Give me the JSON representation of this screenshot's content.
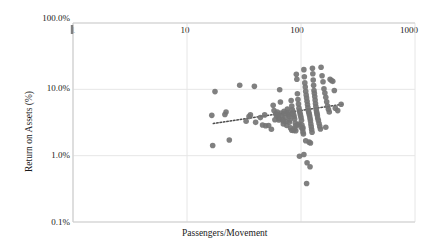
{
  "chart_data": {
    "type": "scatter",
    "title": "",
    "subtitle": "",
    "xlabel": "Passengers/Movement",
    "ylabel": "Return on Assets (%)",
    "x_scale": "log",
    "y_scale": "log",
    "xlim": [
      1,
      1000
    ],
    "ylim": [
      0.001,
      1.0
    ],
    "x_tick_labels": [
      "1",
      "10",
      "100",
      "1000"
    ],
    "x_tick_values": [
      1,
      10,
      100,
      1000
    ],
    "x_axis_position": "top",
    "y_tick_labels": [
      "100.0%",
      "10.0%",
      "1.0%",
      "0.1%"
    ],
    "y_tick_values": [
      1.0,
      0.1,
      0.01,
      0.001
    ],
    "grid": true,
    "grid_axis": "both",
    "legend": "none",
    "marker_color": "#757575",
    "marker_size": 5,
    "trendline": {
      "type": "linear-on-log",
      "style": "dotted",
      "color": "#4d4d4d",
      "x_start": 17,
      "y_start": 0.0305,
      "x_end": 230,
      "y_end": 0.0595
    },
    "series": [
      {
        "name": "Airports",
        "points": [
          [
            17.6,
            0.0925
          ],
          [
            16.5,
            0.0405
          ],
          [
            16.8,
            0.0142
          ],
          [
            22.0,
            0.0455
          ],
          [
            21.5,
            0.0418
          ],
          [
            23.5,
            0.0172
          ],
          [
            29.0,
            0.1155
          ],
          [
            33.0,
            0.033
          ],
          [
            39.0,
            0.111
          ],
          [
            40.0,
            0.0318
          ],
          [
            44.0,
            0.0375
          ],
          [
            46.0,
            0.029
          ],
          [
            49.0,
            0.0282
          ],
          [
            52.0,
            0.0285
          ],
          [
            55.0,
            0.025
          ],
          [
            57.0,
            0.0575
          ],
          [
            58.0,
            0.0478
          ],
          [
            60.0,
            0.043
          ],
          [
            61.0,
            0.0395
          ],
          [
            62.0,
            0.0455
          ],
          [
            63.0,
            0.0412
          ],
          [
            64.0,
            0.0368
          ],
          [
            65.0,
            0.0985
          ],
          [
            66.0,
            0.0645
          ],
          [
            67.0,
            0.044
          ],
          [
            68.0,
            0.04
          ],
          [
            69.0,
            0.0352
          ],
          [
            70.0,
            0.03
          ],
          [
            71.0,
            0.0465
          ],
          [
            72.0,
            0.0435
          ],
          [
            73.0,
            0.038
          ],
          [
            74.0,
            0.0328
          ],
          [
            75.0,
            0.0285
          ],
          [
            76.0,
            0.0505
          ],
          [
            77.0,
            0.0448
          ],
          [
            78.0,
            0.0415
          ],
          [
            79.0,
            0.0388
          ],
          [
            80.0,
            0.0345
          ],
          [
            81.0,
            0.0262
          ],
          [
            82.0,
            0.068
          ],
          [
            83.0,
            0.056
          ],
          [
            84.0,
            0.049
          ],
          [
            85.0,
            0.0455
          ],
          [
            86.0,
            0.042
          ],
          [
            87.0,
            0.039
          ],
          [
            88.0,
            0.0358
          ],
          [
            89.0,
            0.031
          ],
          [
            90.0,
            0.0238
          ],
          [
            91.0,
            0.169
          ],
          [
            92.0,
            0.142
          ],
          [
            93.0,
            0.086
          ],
          [
            94.0,
            0.07
          ],
          [
            95.0,
            0.06
          ],
          [
            96.0,
            0.052
          ],
          [
            97.0,
            0.047
          ],
          [
            98.0,
            0.044
          ],
          [
            99.0,
            0.0408
          ],
          [
            100.0,
            0.0375
          ],
          [
            101.0,
            0.0342
          ],
          [
            102.0,
            0.029
          ],
          [
            103.0,
            0.0255
          ],
          [
            104.0,
            0.0228
          ],
          [
            105.0,
            0.0212
          ],
          [
            106.0,
            0.198
          ],
          [
            107.0,
            0.155
          ],
          [
            108.0,
            0.125
          ],
          [
            109.0,
            0.108
          ],
          [
            110.0,
            0.093
          ],
          [
            111.0,
            0.082
          ],
          [
            112.0,
            0.074
          ],
          [
            113.0,
            0.066
          ],
          [
            114.0,
            0.059
          ],
          [
            115.0,
            0.053
          ],
          [
            116.0,
            0.048
          ],
          [
            117.0,
            0.045
          ],
          [
            118.0,
            0.0425
          ],
          [
            119.0,
            0.0398
          ],
          [
            120.0,
            0.0365
          ],
          [
            121.0,
            0.0335
          ],
          [
            122.0,
            0.03
          ],
          [
            123.0,
            0.0272
          ],
          [
            124.0,
            0.0248
          ],
          [
            125.0,
            0.0225
          ],
          [
            126.0,
            0.208
          ],
          [
            127.0,
            0.172
          ],
          [
            128.0,
            0.138
          ],
          [
            129.0,
            0.115
          ],
          [
            130.0,
            0.096
          ],
          [
            131.0,
            0.087
          ],
          [
            132.0,
            0.078
          ],
          [
            133.0,
            0.069
          ],
          [
            134.0,
            0.061
          ],
          [
            135.0,
            0.055
          ],
          [
            136.0,
            0.0495
          ],
          [
            137.0,
            0.046
          ],
          [
            138.0,
            0.0432
          ],
          [
            139.0,
            0.0405
          ],
          [
            140.0,
            0.037
          ],
          [
            142.0,
            0.034
          ],
          [
            144.0,
            0.0305
          ],
          [
            146.0,
            0.0276
          ],
          [
            148.0,
            0.0252
          ],
          [
            150.0,
            0.215
          ],
          [
            153.0,
            0.16
          ],
          [
            156.0,
            0.13
          ],
          [
            159.0,
            0.102
          ],
          [
            162.0,
            0.088
          ],
          [
            165.0,
            0.076
          ],
          [
            168.0,
            0.065
          ],
          [
            171.0,
            0.056
          ],
          [
            174.0,
            0.05
          ],
          [
            177.0,
            0.0455
          ],
          [
            180.0,
            0.142
          ],
          [
            185.0,
            0.136
          ],
          [
            190.0,
            0.132
          ],
          [
            196.0,
            0.096
          ],
          [
            200.0,
            0.052
          ],
          [
            210.0,
            0.0478
          ],
          [
            225.0,
            0.0595
          ],
          [
            165.0,
            0.0268
          ],
          [
            118.0,
            0.016
          ],
          [
            121.0,
            0.0155
          ],
          [
            110.0,
            0.0168
          ],
          [
            97.0,
            0.0098
          ],
          [
            106.0,
            0.0104
          ],
          [
            113.0,
            0.0078
          ],
          [
            120.0,
            0.0068
          ],
          [
            112.0,
            0.0038
          ],
          [
            83.0,
            0.0242
          ],
          [
            86.0,
            0.024
          ],
          [
            64.0,
            0.0345
          ],
          [
            48.0,
            0.0412
          ],
          [
            36.0,
            0.0412
          ],
          [
            35.0,
            0.0388
          ],
          [
            96.0,
            0.03
          ],
          [
            93.0,
            0.0292
          ],
          [
            90.0,
            0.0282
          ],
          [
            100.0,
            0.027
          ],
          [
            104.0,
            0.0262
          ],
          [
            88.0,
            0.0255
          ],
          [
            79.0,
            0.0318
          ],
          [
            70.0,
            0.033
          ],
          [
            59.0,
            0.0348
          ]
        ]
      }
    ]
  },
  "axes": {
    "y_title": "Return on Assets (%)",
    "x_title": "Passengers/Movement"
  }
}
